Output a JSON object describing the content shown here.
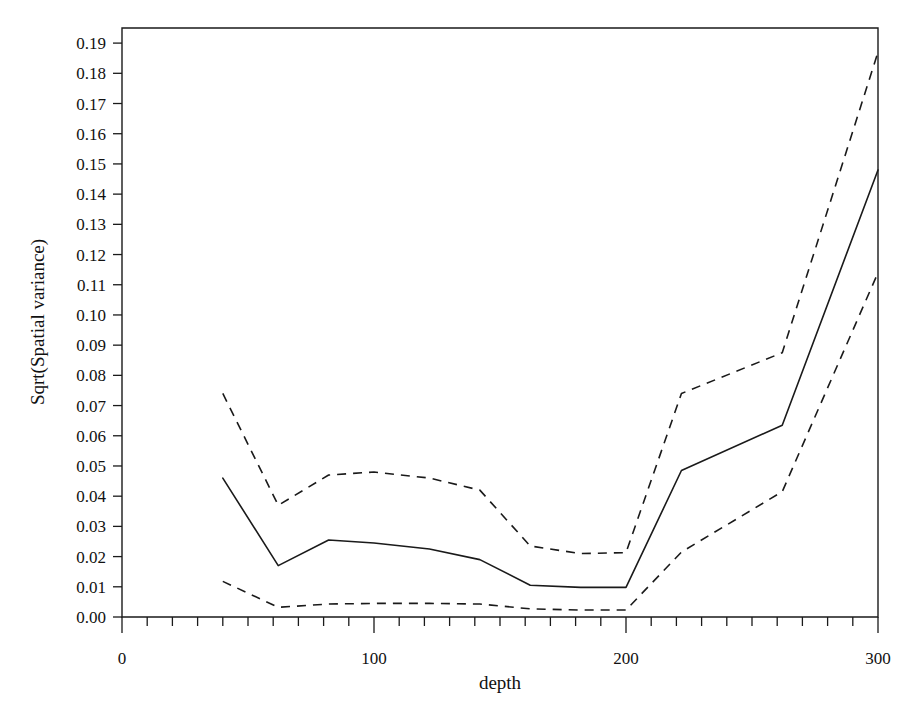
{
  "figure": {
    "background": "#ffffff",
    "ink_color": "#1a1a1a",
    "width": 915,
    "height": 727
  },
  "axes": {
    "x_title": "depth",
    "y_title": "Sqrt(Spatial variance)",
    "x_major_labels": [
      "0",
      "100",
      "200",
      "300"
    ],
    "y_major_labels": [
      "0.00",
      "0.01",
      "0.02",
      "0.03",
      "0.04",
      "0.05",
      "0.06",
      "0.07",
      "0.08",
      "0.09",
      "0.10",
      "0.11",
      "0.12",
      "0.13",
      "0.14",
      "0.15",
      "0.16",
      "0.17",
      "0.18",
      "0.19"
    ]
  },
  "chart_data": {
    "type": "line",
    "title": "",
    "xlabel": "depth",
    "ylabel": "Sqrt(Spatial variance)",
    "xlim": [
      0,
      300
    ],
    "ylim": [
      0.0,
      0.195
    ],
    "grid": false,
    "legend": "none",
    "x_ticks_major": [
      0,
      100,
      200,
      300
    ],
    "x_ticks_minor_step": 10,
    "y_ticks_major": [
      0.0,
      0.01,
      0.02,
      0.03,
      0.04,
      0.05,
      0.06,
      0.07,
      0.08,
      0.09,
      0.1,
      0.11,
      0.12,
      0.13,
      0.14,
      0.15,
      0.16,
      0.17,
      0.18,
      0.19
    ],
    "x": [
      40,
      62,
      82,
      100,
      122,
      142,
      162,
      182,
      200,
      222,
      262,
      300
    ],
    "series": [
      {
        "name": "upper confidence band",
        "style": "dashed",
        "values": [
          0.074,
          0.037,
          0.047,
          0.048,
          0.046,
          0.042,
          0.0235,
          0.021,
          0.0213,
          0.074,
          0.0875,
          0.187
        ]
      },
      {
        "name": "estimate",
        "style": "solid",
        "values": [
          0.046,
          0.017,
          0.0255,
          0.0245,
          0.0225,
          0.019,
          0.0105,
          0.0098,
          0.0098,
          0.0485,
          0.0635,
          0.148
        ]
      },
      {
        "name": "lower confidence band",
        "style": "dashed",
        "values": [
          0.0118,
          0.0032,
          0.0043,
          0.0045,
          0.0045,
          0.0043,
          0.0027,
          0.0023,
          0.0023,
          0.0215,
          0.0415,
          0.114
        ]
      }
    ]
  }
}
